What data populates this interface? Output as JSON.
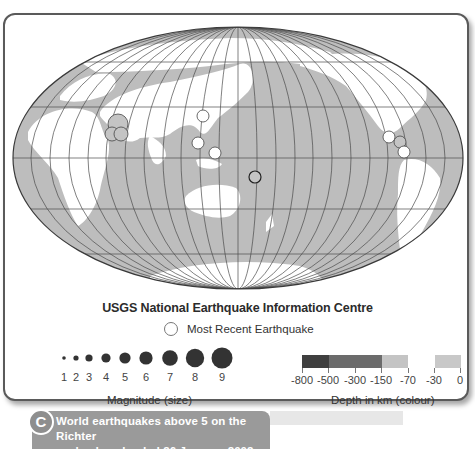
{
  "figure": {
    "title": "USGS National Earthquake Information Centre",
    "recent_label": "Most Recent Earthquake",
    "caption_letter": "C",
    "caption_lines": [
      "World earthquakes above 5 on the Richter",
      "scale, downloaded 26 January 2002"
    ]
  },
  "magnitude_legend": {
    "caption": "Magnitude (size)",
    "labels": [
      "1",
      "2",
      "3",
      "4",
      "5",
      "6",
      "7",
      "8",
      "9"
    ],
    "dot_color": "#333333"
  },
  "depth_legend": {
    "caption": "Depth in km (colour)",
    "tick_labels": [
      "-800",
      "-500",
      "-300",
      "-150",
      "-70",
      "-30",
      "0"
    ],
    "segment_colors": [
      "#3f3f3f",
      "#6b6b6b",
      "#6b6b6b",
      "#c4c4c4",
      "#ffffff",
      "#c8c8c8"
    ]
  },
  "map": {
    "projection": "Mollweide-style ellipse, Pacific-centred",
    "ocean_color": "#bdbdbd",
    "land_color": "#ffffff",
    "earthquakes": [
      {
        "region": "Middle East",
        "x": 118,
        "y": 124,
        "r": 10,
        "fill": "#c4c4c4"
      },
      {
        "region": "Middle East",
        "x": 112,
        "y": 134,
        "r": 7,
        "fill": "#c4c4c4"
      },
      {
        "region": "Middle East",
        "x": 121,
        "y": 134,
        "r": 7,
        "fill": "#c4c4c4"
      },
      {
        "region": "East Asia",
        "x": 203,
        "y": 116,
        "r": 6,
        "fill": "#ffffff"
      },
      {
        "region": "Taiwan/Philippines",
        "x": 198,
        "y": 143,
        "r": 6,
        "fill": "#ffffff"
      },
      {
        "region": "Philippines",
        "x": 215,
        "y": 153,
        "r": 6,
        "fill": "#ffffff"
      },
      {
        "region": "Southwest Pacific",
        "x": 255,
        "y": 177,
        "r": 6,
        "fill": "#c4c4c4",
        "most_recent": true
      },
      {
        "region": "Mexico",
        "x": 389,
        "y": 137,
        "r": 6,
        "fill": "#ffffff"
      },
      {
        "region": "Central America",
        "x": 400,
        "y": 142,
        "r": 6,
        "fill": "#c4c4c4"
      },
      {
        "region": "Central America",
        "x": 404,
        "y": 152,
        "r": 6,
        "fill": "#ffffff"
      }
    ]
  }
}
